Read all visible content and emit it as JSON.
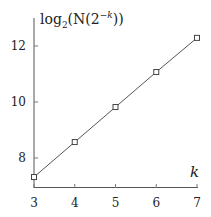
{
  "chart_data": {
    "type": "line",
    "title": "",
    "xlabel": "k",
    "ylabel": "log2(N(2^-k))",
    "ylabel_parts": {
      "base": "log",
      "sub": "2",
      "open": "(N(2",
      "sup": "−k",
      "close": "))"
    },
    "x": [
      3,
      4,
      5,
      6,
      7
    ],
    "series": [
      {
        "name": "log2(N(2^-k))",
        "values": [
          7.32,
          8.57,
          9.82,
          11.07,
          12.29
        ],
        "marker": "square",
        "color": "#555555"
      }
    ],
    "xlim": [
      3,
      7
    ],
    "ylim": [
      7.0,
      13.2
    ],
    "xticks": [
      "3",
      "4",
      "5",
      "6",
      "7"
    ],
    "yticks": [
      "8",
      "10",
      "12"
    ],
    "grid": false,
    "legend": null
  }
}
